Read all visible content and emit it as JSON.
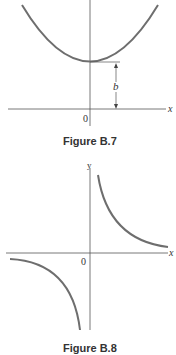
{
  "figures": [
    {
      "caption": "Figure B.7",
      "x_label": "x",
      "origin_label": "0",
      "dimension_label": "b",
      "curve": "parabola",
      "curve_color": "#6e6e6e"
    },
    {
      "caption": "Figure B.8",
      "x_label": "x",
      "y_label": "y",
      "origin_label": "0",
      "curve": "hyperbola",
      "curve_color": "#6e6e6e"
    }
  ]
}
